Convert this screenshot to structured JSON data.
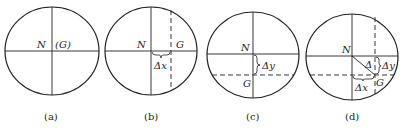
{
  "figure": {
    "panels": [
      {
        "id": "a",
        "caption": "(a)",
        "label_n": "N",
        "label_g": "(G)"
      },
      {
        "id": "b",
        "caption": "(b)",
        "label_n": "N",
        "label_g": "G",
        "label_offset": "Δx"
      },
      {
        "id": "c",
        "caption": "(c)",
        "label_n": "N",
        "label_g": "G",
        "label_offset": "Δy"
      },
      {
        "id": "d",
        "caption": "(d)",
        "label_n": "N",
        "label_g": "G",
        "label_delta": "Δ",
        "label_dx": "Δx",
        "label_dy": "Δy"
      }
    ],
    "colors": {
      "stroke": "#222222",
      "background": "#ffffff"
    }
  }
}
